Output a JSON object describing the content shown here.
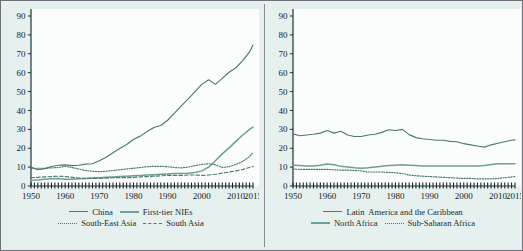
{
  "figure": {
    "background_color": "#e6f1ef",
    "line_color_dark": "#4c7a72",
    "line_color_light": "#6f9e95",
    "axis_color": "#243038"
  },
  "panels": [
    {
      "id": "left",
      "legend_rows": [
        [
          {
            "label": "China",
            "style": "solid-dark"
          },
          {
            "label": "First-tier NIEs",
            "style": "solid-light"
          }
        ],
        [
          {
            "label": "South-East Asia",
            "style": "dotted"
          },
          {
            "label": "South Asia",
            "style": "dashed"
          }
        ]
      ]
    },
    {
      "id": "right",
      "legend_rows": [
        [
          {
            "label": "Latin  America and the Caribbean",
            "style": "solid-dark"
          }
        ],
        [
          {
            "label": "North Africa",
            "style": "solid-light"
          },
          {
            "label": "Sub-Saharan Africa",
            "style": "dotted"
          }
        ]
      ]
    }
  ],
  "chart_data": [
    {
      "type": "line",
      "title": "",
      "xlabel": "",
      "ylabel": "",
      "xlim": [
        1950,
        2015
      ],
      "ylim": [
        0,
        90
      ],
      "yticks": [
        0,
        10,
        20,
        30,
        40,
        50,
        60,
        70,
        80,
        90
      ],
      "xticks": [
        1950,
        1960,
        1970,
        1980,
        1990,
        2000,
        2010,
        2015
      ],
      "grid": false,
      "legend_position": "below",
      "x": [
        1950,
        1952,
        1954,
        1956,
        1958,
        1960,
        1962,
        1964,
        1966,
        1968,
        1970,
        1972,
        1974,
        1976,
        1978,
        1980,
        1982,
        1984,
        1986,
        1988,
        1990,
        1992,
        1994,
        1996,
        1998,
        2000,
        2002,
        2004,
        2006,
        2008,
        2010,
        2012,
        2014,
        2015
      ],
      "series": [
        {
          "name": "China",
          "style": "solid-dark",
          "values": [
            10.0,
            8.6,
            9.2,
            10.3,
            11.0,
            11.2,
            10.8,
            11.0,
            11.6,
            11.8,
            13.4,
            15.2,
            17.6,
            19.8,
            22.0,
            24.6,
            26.4,
            28.8,
            31.0,
            32.0,
            34.8,
            38.6,
            42.4,
            46.0,
            50.0,
            53.8,
            56.2,
            53.8,
            57.0,
            60.2,
            62.6,
            66.4,
            71.0,
            74.6
          ]
        },
        {
          "name": "First-tier NIEs",
          "style": "solid-light",
          "values": [
            3.0,
            3.2,
            3.6,
            3.8,
            4.0,
            3.6,
            3.6,
            3.8,
            4.0,
            4.2,
            4.4,
            4.6,
            4.8,
            5.0,
            5.2,
            5.4,
            5.6,
            5.8,
            6.0,
            6.2,
            6.4,
            6.6,
            6.6,
            6.8,
            7.2,
            8.0,
            10.0,
            13.4,
            17.0,
            20.2,
            23.6,
            27.0,
            30.0,
            31.2
          ]
        },
        {
          "name": "South-East Asia",
          "style": "dotted",
          "values": [
            9.2,
            9.4,
            9.4,
            9.6,
            9.8,
            10.4,
            9.8,
            9.0,
            8.2,
            7.8,
            7.6,
            7.8,
            8.2,
            8.6,
            9.0,
            9.4,
            9.8,
            10.2,
            10.4,
            10.4,
            10.2,
            9.8,
            9.6,
            10.0,
            10.8,
            11.4,
            11.8,
            11.2,
            9.8,
            10.2,
            11.4,
            13.0,
            15.6,
            17.8
          ]
        },
        {
          "name": "South Asia",
          "style": "dashed",
          "values": [
            4.4,
            4.6,
            4.8,
            5.0,
            5.2,
            5.0,
            4.6,
            4.2,
            4.0,
            4.0,
            4.0,
            4.2,
            4.4,
            4.4,
            4.4,
            4.6,
            4.8,
            5.0,
            5.2,
            5.4,
            5.6,
            5.6,
            5.6,
            5.8,
            5.8,
            5.6,
            5.8,
            6.2,
            6.8,
            7.4,
            8.0,
            8.8,
            9.8,
            10.4
          ]
        }
      ]
    },
    {
      "type": "line",
      "title": "",
      "xlabel": "",
      "ylabel": "",
      "xlim": [
        1950,
        2015
      ],
      "ylim": [
        0,
        90
      ],
      "yticks": [
        0,
        10,
        20,
        30,
        40,
        50,
        60,
        70,
        80,
        90
      ],
      "xticks": [
        1950,
        1960,
        1970,
        1980,
        1990,
        2000,
        2010,
        2015
      ],
      "grid": false,
      "legend_position": "below",
      "x": [
        1950,
        1952,
        1954,
        1956,
        1958,
        1960,
        1962,
        1964,
        1966,
        1968,
        1970,
        1972,
        1974,
        1976,
        1978,
        1980,
        1982,
        1984,
        1986,
        1988,
        1990,
        1992,
        1994,
        1996,
        1998,
        2000,
        2002,
        2004,
        2006,
        2008,
        2010,
        2012,
        2014,
        2015
      ],
      "series": [
        {
          "name": "Latin  America and the Caribbean",
          "style": "solid-dark",
          "values": [
            27.6,
            26.6,
            27.0,
            27.4,
            28.0,
            29.4,
            28.0,
            29.0,
            27.0,
            26.2,
            26.2,
            27.0,
            27.4,
            28.4,
            29.8,
            29.4,
            30.0,
            27.2,
            25.6,
            25.0,
            24.6,
            24.2,
            24.2,
            23.6,
            23.4,
            22.4,
            21.8,
            21.2,
            20.6,
            21.8,
            22.6,
            23.4,
            24.2,
            24.4
          ]
        },
        {
          "name": "North Africa",
          "style": "solid-light",
          "values": [
            11.0,
            10.8,
            10.6,
            10.6,
            11.0,
            11.6,
            11.2,
            10.4,
            10.0,
            9.6,
            9.4,
            9.6,
            10.0,
            10.4,
            10.8,
            11.0,
            11.2,
            11.0,
            10.8,
            10.6,
            10.6,
            10.6,
            10.6,
            10.6,
            10.6,
            10.6,
            10.6,
            10.6,
            10.8,
            11.4,
            11.8,
            11.8,
            11.8,
            11.8
          ]
        },
        {
          "name": "Sub-Saharan Africa",
          "style": "dotted",
          "values": [
            9.0,
            8.8,
            8.8,
            8.8,
            8.8,
            8.8,
            8.6,
            8.4,
            8.4,
            8.2,
            8.0,
            7.4,
            7.4,
            7.4,
            7.2,
            7.0,
            6.6,
            5.8,
            5.4,
            5.2,
            5.0,
            4.8,
            4.6,
            4.4,
            4.2,
            4.0,
            4.0,
            3.8,
            3.8,
            3.8,
            4.0,
            4.4,
            4.8,
            5.0
          ]
        }
      ]
    }
  ]
}
